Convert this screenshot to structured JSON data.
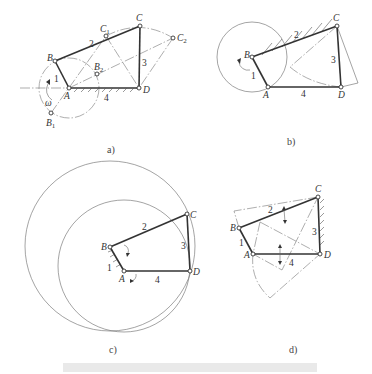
{
  "figure": {
    "panels": [
      {
        "id": "a",
        "caption": "a)",
        "labels": {
          "A": "A",
          "B": "B",
          "C": "C",
          "D": "D",
          "B1": "B",
          "B1_sub": "1",
          "B2": "B",
          "B2_sub": "2",
          "C1": "C",
          "C1_sub": "1",
          "C2": "C",
          "C2_sub": "2",
          "omega": "ω"
        },
        "link_numbers": {
          "l1": "1",
          "l2": "2",
          "l3": "3",
          "l4": "4"
        }
      },
      {
        "id": "b",
        "caption": "b)",
        "labels": {
          "A": "A",
          "B": "B",
          "C": "C",
          "D": "D"
        },
        "link_numbers": {
          "l1": "1",
          "l2": "2",
          "l3": "3",
          "l4": "4"
        }
      },
      {
        "id": "c",
        "caption": "c)",
        "labels": {
          "A": "A",
          "B": "B",
          "C": "C",
          "D": "D"
        },
        "link_numbers": {
          "l1": "1",
          "l2": "2",
          "l3": "3",
          "l4": "4"
        }
      },
      {
        "id": "d",
        "caption": "d)",
        "labels": {
          "A": "A",
          "B": "B",
          "C": "C",
          "D": "D"
        },
        "link_numbers": {
          "l1": "1",
          "l2": "2",
          "l3": "3",
          "l4": "4"
        }
      }
    ],
    "colors": {
      "ink": "#333333",
      "construction": "#777777",
      "bar": "#e9e9e9"
    }
  }
}
